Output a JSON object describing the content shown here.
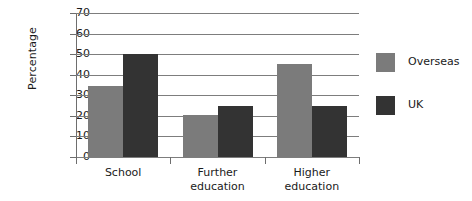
{
  "chart_data": {
    "type": "bar",
    "title": "",
    "subtitle": "",
    "xlabel": "",
    "ylabel": "Percentage",
    "ylim": [
      0,
      70
    ],
    "ytick_values": [
      0,
      10,
      20,
      30,
      40,
      50,
      60,
      70
    ],
    "ytick_labels": [
      "0",
      "10",
      "20",
      "30",
      "40",
      "50",
      "60",
      "70"
    ],
    "grid": true,
    "grid_axis": "y",
    "legend_position": "right",
    "categories": [
      "School",
      "Further education",
      "Higher education"
    ],
    "category_lines": [
      [
        "School"
      ],
      [
        "Further",
        "education"
      ],
      [
        "Higher",
        "education"
      ]
    ],
    "series": [
      {
        "name": "Overseas",
        "color": "#7b7b7b",
        "values": [
          34.5,
          20.5,
          45
        ]
      },
      {
        "name": "UK",
        "color": "#333333",
        "values": [
          50,
          25,
          25
        ]
      }
    ],
    "annotations": []
  },
  "colors": {
    "overseas": "#7b7b7b",
    "uk": "#333333",
    "axis": "#6e6e6e",
    "grid": "#7d7d7d",
    "text": "#1a1a1a",
    "background": "#ffffff"
  },
  "legend": {
    "items": [
      {
        "label": "Overseas",
        "swatch": "#7b7b7b"
      },
      {
        "label": "UK",
        "swatch": "#333333"
      }
    ]
  }
}
